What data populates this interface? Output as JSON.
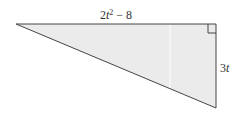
{
  "diagram": {
    "type": "right-triangle",
    "labels": {
      "top_side": "2t² − 8",
      "right_side": "3t"
    },
    "colors": {
      "fill": "#ebebeb",
      "stroke": "#444444",
      "divider": "#ffffff"
    },
    "vertices": {
      "left": [
        16,
        24
      ],
      "top_right": [
        216,
        24
      ],
      "bottom_right": [
        216,
        108
      ]
    },
    "right_angle_marker": "top-right"
  }
}
